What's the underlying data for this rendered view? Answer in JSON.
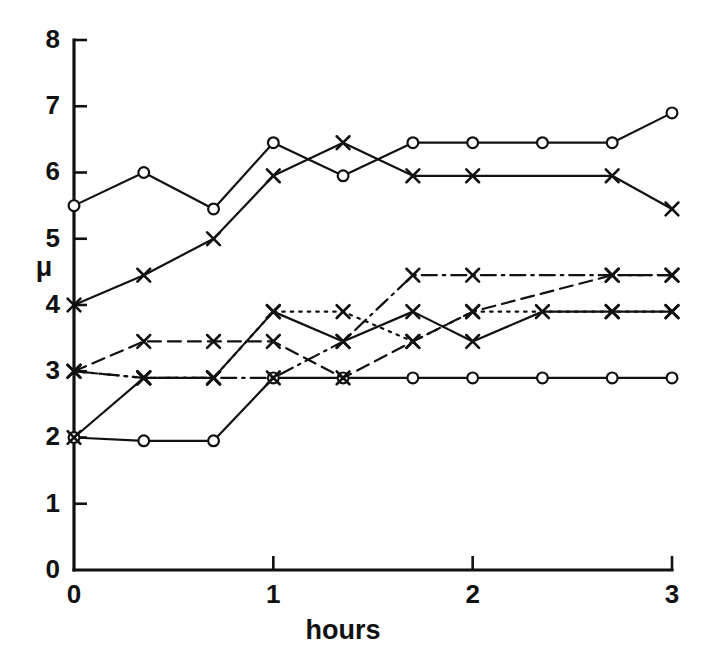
{
  "chart_data": {
    "type": "line",
    "title": "",
    "subtitle": "",
    "xlabel": "hours",
    "ylabel": "μ",
    "xlim": [
      0,
      3
    ],
    "ylim": [
      0,
      8
    ],
    "xticks": [
      0,
      1,
      2,
      3
    ],
    "xtick_labels": [
      "0",
      "1",
      "2",
      "3"
    ],
    "yticks": [
      0,
      1,
      2,
      3,
      4,
      5,
      6,
      7,
      8
    ],
    "ytick_labels": [
      "0",
      "1",
      "2",
      "3",
      "4",
      "5",
      "6",
      "7",
      "8"
    ],
    "grid": false,
    "legend": "none",
    "x": [
      0,
      0.35,
      0.7,
      1.0,
      1.35,
      1.7,
      2.0,
      2.35,
      2.7,
      3.0
    ],
    "series": [
      {
        "name": "upper-circles-solid",
        "marker": "circle",
        "linestyle": "solid",
        "color": "#111111",
        "x": [
          0,
          0.35,
          0.7,
          1.0,
          1.35,
          1.7,
          2.0,
          2.35,
          2.7,
          3.0
        ],
        "values": [
          5.5,
          6.0,
          5.45,
          6.45,
          5.95,
          6.45,
          6.45,
          6.45,
          6.45,
          6.9
        ]
      },
      {
        "name": "upper-crosses-solid",
        "marker": "cross",
        "linestyle": "solid",
        "color": "#111111",
        "x": [
          0,
          0.35,
          0.7,
          1.0,
          1.35,
          1.7,
          2.0,
          2.7,
          3.0
        ],
        "values": [
          4.0,
          4.45,
          5.0,
          5.95,
          6.45,
          5.95,
          5.95,
          5.95,
          5.45
        ]
      },
      {
        "name": "lower-circles-solid-flat",
        "marker": "circle",
        "linestyle": "solid",
        "color": "#111111",
        "x": [
          0,
          0.35,
          0.7,
          1.0,
          1.35,
          1.7,
          2.0,
          2.35,
          2.7,
          3.0
        ],
        "values": [
          2.0,
          1.95,
          1.95,
          2.9,
          2.9,
          2.9,
          2.9,
          2.9,
          2.9,
          2.9
        ]
      },
      {
        "name": "lower-crosses-dashed",
        "marker": "cross",
        "linestyle": "dashed",
        "color": "#111111",
        "x": [
          0,
          0.35,
          0.7,
          1.0,
          1.35,
          1.7,
          2.0,
          2.7,
          3.0
        ],
        "values": [
          3.0,
          3.45,
          3.45,
          3.45,
          2.9,
          3.45,
          3.9,
          4.45,
          4.45
        ]
      },
      {
        "name": "lower-crosses-dotted",
        "marker": "cross",
        "linestyle": "dotted",
        "color": "#111111",
        "x": [
          0,
          0.35,
          0.7,
          1.0,
          1.35,
          1.7,
          2.0,
          2.7,
          3.0
        ],
        "values": [
          3.0,
          2.9,
          2.9,
          3.9,
          3.9,
          3.45,
          3.9,
          3.9,
          3.9
        ]
      },
      {
        "name": "lower-crosses-dashdot",
        "marker": "cross",
        "linestyle": "dashdot",
        "color": "#111111",
        "x": [
          0,
          0.35,
          0.7,
          1.0,
          1.35,
          1.7,
          2.0,
          2.7,
          3.0
        ],
        "values": [
          3.0,
          2.9,
          2.9,
          2.9,
          3.45,
          4.45,
          4.45,
          4.45,
          4.45
        ]
      },
      {
        "name": "lower-crosses-solid",
        "marker": "cross",
        "linestyle": "solid",
        "color": "#111111",
        "x": [
          0,
          0.35,
          0.7,
          1.0,
          1.35,
          1.7,
          2.0,
          2.35,
          2.7,
          3.0
        ],
        "values": [
          2.0,
          2.9,
          2.9,
          3.9,
          3.45,
          3.9,
          3.45,
          3.9,
          3.9,
          3.9
        ]
      }
    ]
  }
}
